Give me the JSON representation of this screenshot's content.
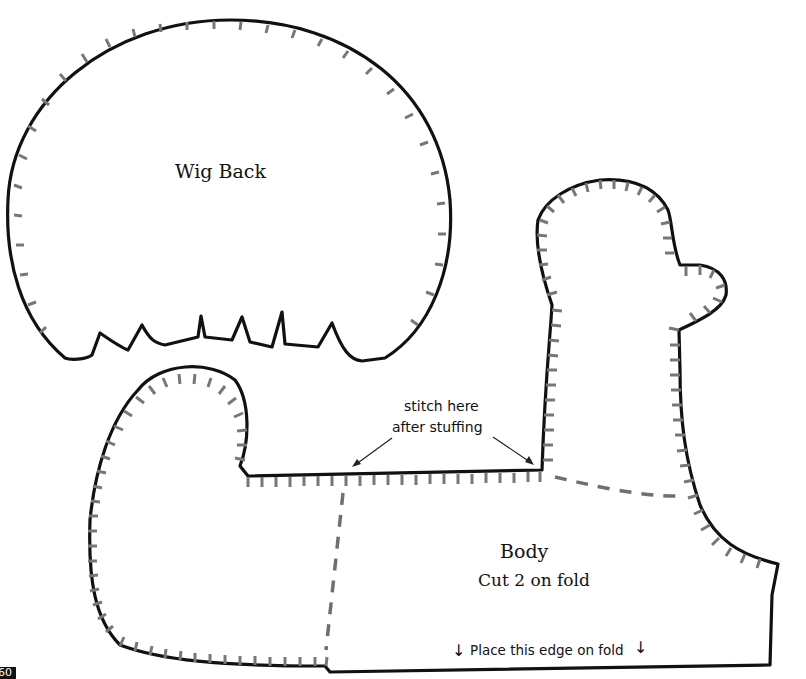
{
  "page": {
    "number": "60"
  },
  "pieces": {
    "wig_back": {
      "label": "Wig Back"
    },
    "body": {
      "label": "Body",
      "instruction": "Cut 2 on fold"
    }
  },
  "annotations": {
    "stitch_line1": "stitch here",
    "stitch_line2": "after stuffing",
    "fold_text": "Place this edge on fold",
    "fold_arrow": "↓"
  },
  "colors": {
    "outline": "#111111",
    "seam_ticks": "#777777",
    "dashed_line": "#6f6f6f"
  }
}
